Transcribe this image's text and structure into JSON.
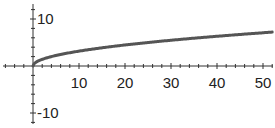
{
  "chart_data": {
    "type": "line",
    "title": "",
    "xlabel": "",
    "ylabel": "",
    "function": "y = sqrt(x)",
    "xlim": [
      -6,
      52
    ],
    "ylim": [
      -13,
      13
    ],
    "grid": false,
    "legend": null,
    "x_ticks": [
      10,
      20,
      30,
      40,
      50
    ],
    "x_tick_labels": [
      "10",
      "20",
      "30",
      "40",
      "50"
    ],
    "y_ticks": [
      10,
      -10
    ],
    "y_tick_labels": [
      "10",
      "-10"
    ],
    "x_minor_tick_step": 2,
    "y_minor_tick_step": 2,
    "series": [
      {
        "name": "sqrt(x)",
        "color": "#555555",
        "x": [
          0,
          0.25,
          1,
          2,
          4,
          6,
          8,
          10,
          15,
          20,
          25,
          30,
          35,
          40,
          45,
          50,
          52
        ],
        "y": [
          0,
          0.5,
          1,
          1.41,
          2,
          2.45,
          2.83,
          3.16,
          3.87,
          4.47,
          5,
          5.48,
          5.92,
          6.32,
          6.71,
          7.07,
          7.21
        ]
      }
    ]
  },
  "colors": {
    "axis": "#333333",
    "curve": "#555555",
    "text": "#222222",
    "background": "#ffffff"
  }
}
